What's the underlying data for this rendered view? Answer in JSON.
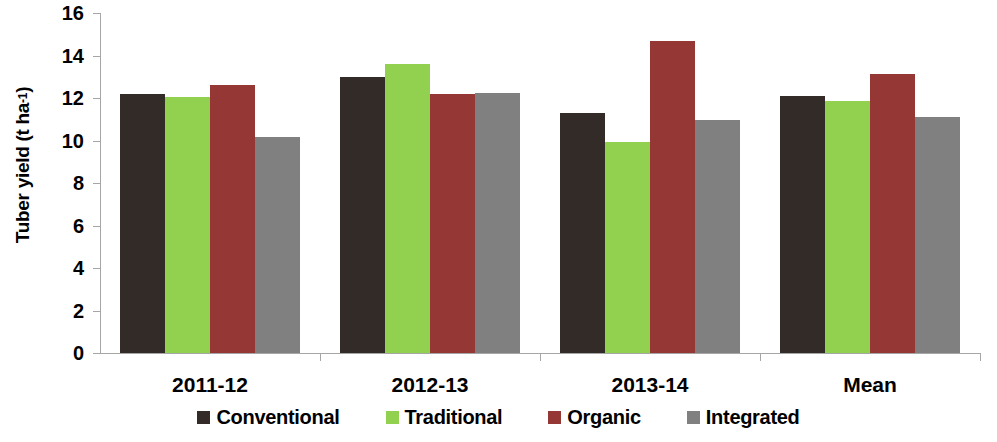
{
  "chart_data": {
    "type": "bar",
    "title": "",
    "xlabel": "",
    "ylabel": "Tuber yield (t ha-1)",
    "ylabel_base": "Tuber yield (t ha",
    "ylabel_exponent": "-1",
    "ylabel_suffix": ")",
    "categories": [
      "2011-12",
      "2012-13",
      "2013-14",
      "Mean"
    ],
    "series": [
      {
        "name": "Conventional",
        "color": "#332b27",
        "values": [
          12.2,
          13.0,
          11.3,
          12.1
        ]
      },
      {
        "name": "Traditional",
        "color": "#92d050",
        "values": [
          12.05,
          13.6,
          9.95,
          11.85
        ]
      },
      {
        "name": "Organic",
        "color": "#953735",
        "values": [
          12.6,
          12.2,
          14.7,
          13.15
        ]
      },
      {
        "name": "Integrated",
        "color": "#808080",
        "values": [
          10.15,
          12.25,
          10.95,
          11.1
        ]
      }
    ],
    "ylim": [
      0,
      16
    ],
    "ytick_step": 2,
    "ytick_labels": [
      "16",
      "14",
      "12",
      "10",
      "8",
      "6",
      "4",
      "2",
      "0"
    ],
    "ytick_values": [
      16,
      14,
      12,
      10,
      8,
      6,
      4,
      2,
      0
    ],
    "grid": false,
    "legend_position": "bottom",
    "axis_color": "#a6a6a6"
  }
}
